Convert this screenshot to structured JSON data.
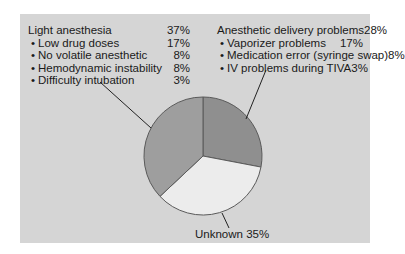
{
  "chart_data": {
    "type": "pie",
    "title": "",
    "slices": [
      {
        "label": "Anesthetic delivery problems",
        "value": 28,
        "color": "#8f8f8f"
      },
      {
        "label": "Unknown",
        "value": 35,
        "color": "#ececec"
      },
      {
        "label": "Light anesthesia",
        "value": 37,
        "color": "#9e9e9e"
      }
    ],
    "annotations": [
      {
        "group": "Light anesthesia",
        "total": "37%",
        "items": [
          {
            "label": "Low drug doses",
            "value": "17%"
          },
          {
            "label": "No volatile anesthetic",
            "value": "8%"
          },
          {
            "label": "Hemodynamic instability",
            "value": "8%"
          },
          {
            "label": "Difficulty intubation",
            "value": "3%"
          }
        ]
      },
      {
        "group": "Anesthetic delivery problems",
        "total": "28%",
        "items": [
          {
            "label": "Vaporizer problems",
            "value": "17%"
          },
          {
            "label": "Medication error (syringe swap)",
            "value": "8%"
          },
          {
            "label": "IV problems during TIVA",
            "value": "3%"
          }
        ]
      },
      {
        "group": "Unknown",
        "total": "35%",
        "items": []
      }
    ],
    "legend_position": "none",
    "grid": false
  },
  "left": {
    "title": "Light anesthesia",
    "total": "37%",
    "items": [
      {
        "label": "Low drug doses",
        "value": "17%"
      },
      {
        "label": "No volatile anesthetic",
        "value": "8%"
      },
      {
        "label": "Hemodynamic instability",
        "value": "8%"
      },
      {
        "label": "Difficulty intubation",
        "value": "3%"
      }
    ]
  },
  "right": {
    "title": "Anesthetic delivery problems",
    "total": "28%",
    "items": [
      {
        "label": "Vaporizer problems",
        "value": "17%"
      },
      {
        "label": "Medication error (syringe swap)",
        "value": "8%"
      },
      {
        "label": "IV problems during TIVA",
        "value": "3%"
      }
    ]
  },
  "bottom": {
    "label": "Unknown 35%"
  },
  "colors": {
    "panel": "#d5d5d5",
    "light_anesthesia": "#9e9e9e",
    "delivery_problems": "#8f8f8f",
    "unknown": "#ececec",
    "outline": "#5a5a5a"
  }
}
